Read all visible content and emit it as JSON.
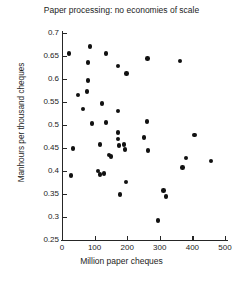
{
  "chart_data": {
    "type": "scatter",
    "title": "Paper processing: no economies of scale",
    "xlabel": "Million paper cheques",
    "ylabel": "Manhours per thousand cheques",
    "xlim": [
      0,
      500
    ],
    "ylim": [
      0.25,
      0.7
    ],
    "xticks": [
      0,
      100,
      200,
      300,
      400,
      500
    ],
    "xtick_labels": [
      "0",
      "100",
      "200",
      "300",
      "400",
      "500"
    ],
    "yticks": [
      0.25,
      0.3,
      0.35,
      0.4,
      0.45,
      0.5,
      0.55,
      0.6,
      0.65,
      0.7
    ],
    "ytick_labels": [
      "0.25",
      "0.3",
      "0.35",
      "0.4",
      "0.45",
      "0.5",
      "0.55",
      "0.6",
      "0.65",
      "0.7"
    ],
    "grid": false,
    "legend": "none",
    "marker": "filled-circle",
    "marker_color": "#111111",
    "points": [
      {
        "x": 21,
        "y": 0.655
      },
      {
        "x": 86,
        "y": 0.671
      },
      {
        "x": 80,
        "y": 0.636
      },
      {
        "x": 135,
        "y": 0.655
      },
      {
        "x": 172,
        "y": 0.628
      },
      {
        "x": 80,
        "y": 0.597
      },
      {
        "x": 263,
        "y": 0.644
      },
      {
        "x": 197,
        "y": 0.612
      },
      {
        "x": 362,
        "y": 0.639
      },
      {
        "x": 49,
        "y": 0.565
      },
      {
        "x": 77,
        "y": 0.573
      },
      {
        "x": 65,
        "y": 0.535
      },
      {
        "x": 123,
        "y": 0.547
      },
      {
        "x": 172,
        "y": 0.53
      },
      {
        "x": 92,
        "y": 0.503
      },
      {
        "x": 135,
        "y": 0.505
      },
      {
        "x": 261,
        "y": 0.508
      },
      {
        "x": 172,
        "y": 0.484
      },
      {
        "x": 172,
        "y": 0.47
      },
      {
        "x": 252,
        "y": 0.473
      },
      {
        "x": 407,
        "y": 0.478
      },
      {
        "x": 117,
        "y": 0.458
      },
      {
        "x": 175,
        "y": 0.455
      },
      {
        "x": 190,
        "y": 0.457
      },
      {
        "x": 34,
        "y": 0.449
      },
      {
        "x": 193,
        "y": 0.447
      },
      {
        "x": 264,
        "y": 0.444
      },
      {
        "x": 144,
        "y": 0.435
      },
      {
        "x": 150,
        "y": 0.431
      },
      {
        "x": 380,
        "y": 0.428
      },
      {
        "x": 457,
        "y": 0.422
      },
      {
        "x": 110,
        "y": 0.4
      },
      {
        "x": 117,
        "y": 0.392
      },
      {
        "x": 129,
        "y": 0.395
      },
      {
        "x": 370,
        "y": 0.407
      },
      {
        "x": 28,
        "y": 0.39
      },
      {
        "x": 196,
        "y": 0.376
      },
      {
        "x": 178,
        "y": 0.349
      },
      {
        "x": 312,
        "y": 0.358
      },
      {
        "x": 319,
        "y": 0.345
      },
      {
        "x": 294,
        "y": 0.292
      }
    ]
  },
  "axes": {
    "x_origin_label": "0"
  }
}
